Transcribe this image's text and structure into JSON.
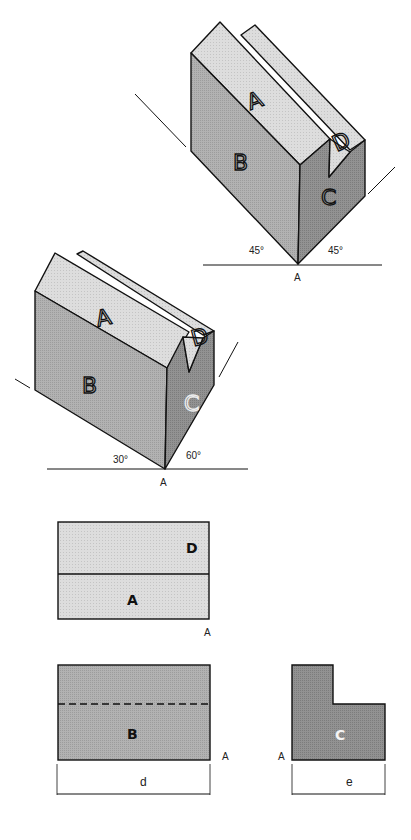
{
  "figure1": {
    "faces": {
      "top": "A",
      "front": "B",
      "side": "C",
      "groove": "D"
    },
    "angle_left": "45°",
    "angle_right": "45°",
    "point": "A"
  },
  "figure2": {
    "faces": {
      "top": "A",
      "front": "B",
      "side": "C",
      "groove": "D"
    },
    "angle_left": "30°",
    "angle_right": "60°",
    "point": "A"
  },
  "view_top": {
    "upper_label": "D",
    "lower_label": "A",
    "point": "A"
  },
  "view_front": {
    "label": "B",
    "point": "A",
    "dimension": "d"
  },
  "view_side": {
    "label": "C",
    "point": "A",
    "dimension": "e"
  },
  "colors": {
    "light": "#dcdcdc",
    "mid": "#b4b4b4",
    "dark": "#8e8e8e",
    "line": "#111111"
  }
}
